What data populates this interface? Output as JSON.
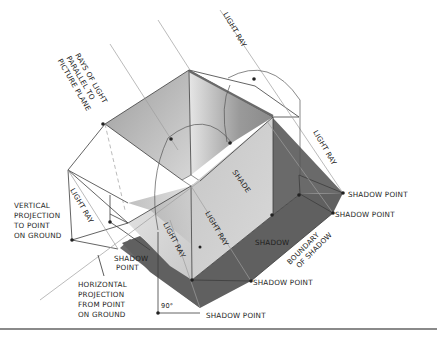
{
  "figure": {
    "type": "technical-illustration",
    "colors": {
      "background": "#ffffff",
      "line": "#3a3a3a",
      "light_ray_line": "#9a9a9a",
      "shadow": "#5e5e5e",
      "shade_face": "#b8b8b8",
      "lit_face_light": "#eeeeee",
      "inner_face": "#a6a6a6",
      "rule": "#8a8a8a"
    }
  },
  "labels": {
    "rays_parallel": [
      "RAYS OF LIGHT",
      "PARALLEL TO",
      "PICTURE PLANE"
    ],
    "light_ray_top": "LIGHT RAY",
    "light_ray_right": "LIGHT RAY",
    "light_ray_left": "LIGHT RAY",
    "light_ray_center": "LIGHT RAY",
    "light_ray_front": "LIGHT RAY",
    "shade": "SHADE",
    "shadow": "SHADOW",
    "boundary_of_shadow": [
      "BOUNDARY",
      "OF SHADOW"
    ],
    "vertical_projection": [
      "VERTICAL",
      "PROJECTION",
      "TO POINT",
      "ON GROUND"
    ],
    "horizontal_projection": [
      "HORIZONTAL",
      "PROJECTION",
      "FROM POINT",
      "ON GROUND"
    ],
    "shadow_point_1": "SHADOW POINT",
    "shadow_point_2": "SHADOW POINT",
    "shadow_point_3": "SHADOW POINT",
    "shadow_point_4": "SHADOW POINT",
    "shadow_point_left": [
      "SHADOW",
      "POINT"
    ],
    "angle": "90°"
  }
}
